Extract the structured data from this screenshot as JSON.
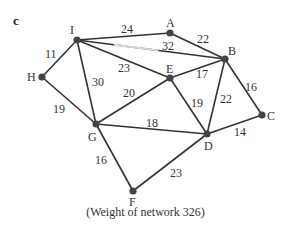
{
  "panel_label": "c",
  "caption": "(Weight of network 326)",
  "colors": {
    "edge": "#333333",
    "node": "#444444",
    "text": "#333333",
    "faded_edge": "#d8d8d8"
  },
  "nodes": [
    {
      "id": "I",
      "x": 77,
      "y": 40,
      "lx": 70,
      "ly": 24
    },
    {
      "id": "A",
      "x": 170,
      "y": 33,
      "lx": 166,
      "ly": 17
    },
    {
      "id": "B",
      "x": 225,
      "y": 59,
      "lx": 228,
      "ly": 45
    },
    {
      "id": "E",
      "x": 170,
      "y": 78,
      "lx": 166,
      "ly": 63
    },
    {
      "id": "H",
      "x": 42,
      "y": 77,
      "lx": 27,
      "ly": 71
    },
    {
      "id": "C",
      "x": 262,
      "y": 115,
      "lx": 267,
      "ly": 110
    },
    {
      "id": "G",
      "x": 96,
      "y": 124,
      "lx": 88,
      "ly": 131
    },
    {
      "id": "D",
      "x": 207,
      "y": 134,
      "lx": 204,
      "ly": 140
    },
    {
      "id": "F",
      "x": 133,
      "y": 191,
      "lx": 129,
      "ly": 196
    }
  ],
  "edges": [
    {
      "from": "I",
      "to": "A",
      "weight": "24",
      "wx": 121,
      "wy": 23
    },
    {
      "from": "A",
      "to": "B",
      "weight": "22",
      "wx": 197,
      "wy": 33
    },
    {
      "from": "I",
      "to": "B",
      "weight": "32",
      "wx": 162,
      "wy": 40,
      "faded": true
    },
    {
      "from": "I",
      "to": "E",
      "weight": "23",
      "wx": 118,
      "wy": 62
    },
    {
      "from": "I",
      "to": "H",
      "weight": "11",
      "wx": 45,
      "wy": 48
    },
    {
      "from": "I",
      "to": "G",
      "weight": "30",
      "wx": 92,
      "wy": 76
    },
    {
      "from": "E",
      "to": "B",
      "weight": "17",
      "wx": 196,
      "wy": 68
    },
    {
      "from": "E",
      "to": "G",
      "weight": "20",
      "wx": 123,
      "wy": 87
    },
    {
      "from": "E",
      "to": "D",
      "weight": "19",
      "wx": 191,
      "wy": 97
    },
    {
      "from": "B",
      "to": "D",
      "weight": "22",
      "wx": 220,
      "wy": 93
    },
    {
      "from": "B",
      "to": "C",
      "weight": "16",
      "wx": 245,
      "wy": 81
    },
    {
      "from": "H",
      "to": "G",
      "weight": "19",
      "wx": 53,
      "wy": 103
    },
    {
      "from": "G",
      "to": "D",
      "weight": "18",
      "wx": 146,
      "wy": 117
    },
    {
      "from": "D",
      "to": "C",
      "weight": "14",
      "wx": 234,
      "wy": 126
    },
    {
      "from": "G",
      "to": "F",
      "weight": "16",
      "wx": 95,
      "wy": 154
    },
    {
      "from": "F",
      "to": "D",
      "weight": "23",
      "wx": 170,
      "wy": 167
    }
  ]
}
